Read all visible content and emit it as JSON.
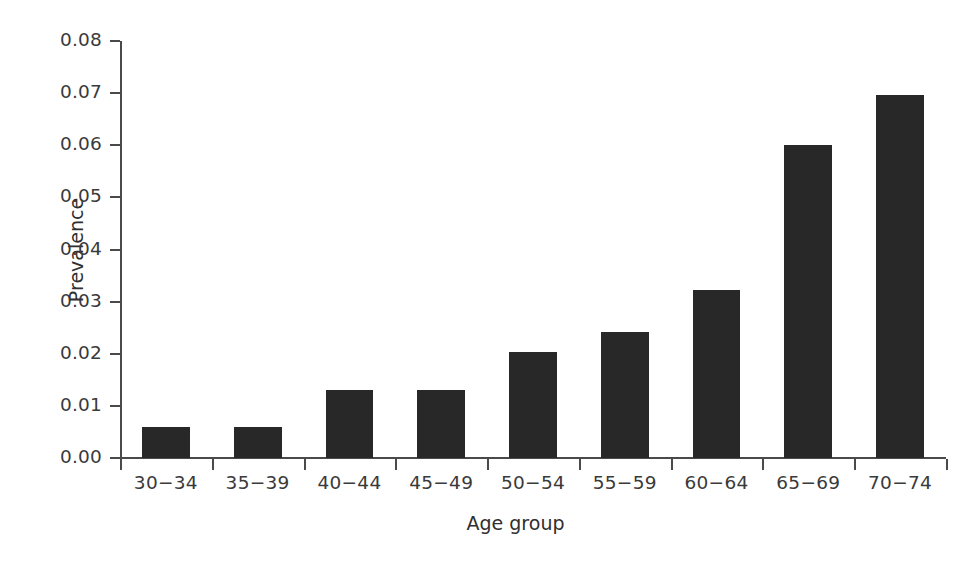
{
  "chart_data": {
    "type": "bar",
    "title": "",
    "subtitle": "",
    "xlabel": "Age group",
    "ylabel": "Prevalence",
    "categories": [
      "30−34",
      "35−39",
      "40−44",
      "45−49",
      "50−54",
      "55−59",
      "60−64",
      "65−69",
      "70−74"
    ],
    "values": [
      0.006,
      0.006,
      0.013,
      0.013,
      0.0203,
      0.0241,
      0.0322,
      0.06,
      0.0697
    ],
    "ylim": [
      0.0,
      0.08
    ],
    "ytick_values": [
      0.0,
      0.01,
      0.02,
      0.03,
      0.04,
      0.05,
      0.06,
      0.07,
      0.08
    ],
    "ytick_labels": [
      "0.00",
      "0.01",
      "0.02",
      "0.03",
      "0.04",
      "0.05",
      "0.06",
      "0.07",
      "0.08"
    ],
    "grid": false,
    "legend": false,
    "legend_position": "none",
    "bar_color": "#282828",
    "axis_color": "#4a4a4a",
    "text_color": "#3a3a3a",
    "background_color": "#ffffff",
    "bar_width_fraction": 0.52
  }
}
